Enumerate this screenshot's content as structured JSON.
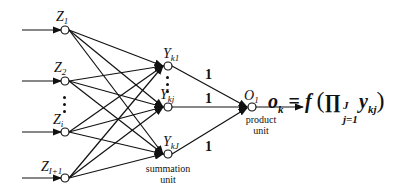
{
  "diagram": {
    "type": "neural-network",
    "input_nodes": [
      {
        "name": "Z",
        "sub": "1"
      },
      {
        "name": "Z",
        "sub": "2"
      },
      {
        "name": "Z",
        "sub": "i"
      },
      {
        "name": "Z",
        "sub": "I+1"
      }
    ],
    "summation_nodes": [
      {
        "name": "Y",
        "sub": "k1"
      },
      {
        "name": "Y",
        "sub": "kj"
      },
      {
        "name": "Y",
        "sub": "kJ"
      }
    ],
    "summation_caption_line1": "summation",
    "summation_caption_line2": "unit",
    "output_node": {
      "name": "O",
      "sub": "1"
    },
    "product_caption_line1": "product",
    "product_caption_line2": "unit",
    "weights": [
      "1",
      "1",
      "1"
    ],
    "formula": {
      "lhs": "o",
      "lhs_sub": "k",
      "eq": "=",
      "func": "f",
      "open": "(",
      "prod": "∏",
      "prod_sup": "J",
      "prod_sub": "j=1",
      "term": "y",
      "term_sub": "kj",
      "close": ")"
    }
  }
}
